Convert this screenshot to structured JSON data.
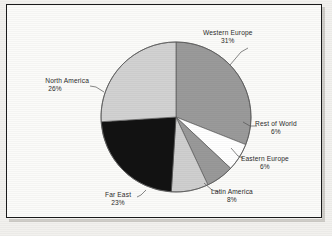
{
  "chart_data": {
    "type": "pie",
    "title": "",
    "subtitle": "",
    "xlabel": "",
    "ylabel": "",
    "legend_position": "none",
    "labels_outside": true,
    "total": "100%",
    "start_angle_deg": 0,
    "direction": "clockwise",
    "categories": [
      "Western Europe",
      "Rest of World",
      "Eastern Europe",
      "Latin America",
      "Far East",
      "North America"
    ],
    "values": [
      31,
      6,
      6,
      8,
      23,
      26
    ],
    "slices": [
      {
        "label": "Western Europe",
        "value": 31,
        "pct_text": "31%",
        "color": "#9a9a9a",
        "start_deg": 0,
        "end_deg": 111.6,
        "label_side": "right"
      },
      {
        "label": "Rest of World",
        "value": 6,
        "pct_text": "6%",
        "color": "#ffffff",
        "start_deg": 111.6,
        "end_deg": 133.2,
        "label_side": "right"
      },
      {
        "label": "Eastern Europe",
        "value": 6,
        "pct_text": "6%",
        "color": "#999999",
        "start_deg": 133.2,
        "end_deg": 154.8,
        "label_side": "right"
      },
      {
        "label": "Latin America",
        "value": 8,
        "pct_text": "8%",
        "color": "#cfcfcf",
        "start_deg": 154.8,
        "end_deg": 183.6,
        "label_side": "center"
      },
      {
        "label": "Far East",
        "value": 23,
        "pct_text": "23%",
        "color": "#121212",
        "start_deg": 183.6,
        "end_deg": 266.4,
        "label_side": "center"
      },
      {
        "label": "North America",
        "value": 26,
        "pct_text": "26%",
        "color": "#d2d2d2",
        "start_deg": 266.4,
        "end_deg": 360,
        "label_side": "left"
      }
    ]
  },
  "figure": {
    "background_color": "#fbfbf9",
    "border_color": "#1a1a1a",
    "text_color": "#2b2b2b",
    "leader_line_color": "#555555",
    "pie_outline_color": "#5a5a5a"
  }
}
